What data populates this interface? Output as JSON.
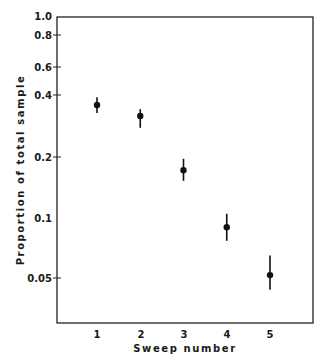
{
  "chart_data": {
    "type": "scatter",
    "title": "",
    "xlabel": "Sweep number",
    "ylabel": "Proportion of total sample",
    "yscale": "log",
    "ylim": [
      0.033,
      1.0
    ],
    "xlim": [
      0.25,
      5.35
    ],
    "grid": false,
    "legend": null,
    "x_ticks": [
      "1",
      "2",
      "3",
      "4",
      "5"
    ],
    "y_ticks": [
      "1.0",
      "0.8",
      "0.6",
      "0.4",
      "0.2",
      "0.1",
      "0.05"
    ],
    "series": [
      {
        "name": "Proportion of total sample",
        "x": [
          1,
          2,
          3,
          4,
          5
        ],
        "values": [
          0.365,
          0.322,
          0.173,
          0.09,
          0.052
        ],
        "error_low": [
          0.333,
          0.281,
          0.153,
          0.077,
          0.044
        ],
        "error_high": [
          0.399,
          0.348,
          0.197,
          0.105,
          0.065
        ]
      }
    ]
  },
  "labels": {
    "xlabel": "Sweep number",
    "ylabel": "Proportion of total sample",
    "y_ticks": [
      "1.0",
      "0.8",
      "0.6",
      "0.4",
      "0.2",
      "0.1",
      "0.05"
    ],
    "x_ticks": [
      "1",
      "2",
      "3",
      "4",
      "5"
    ]
  }
}
